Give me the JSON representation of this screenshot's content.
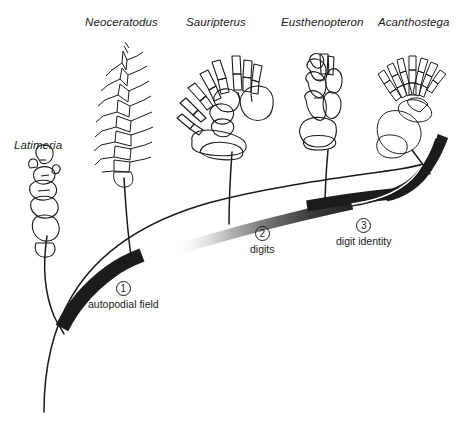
{
  "figure": {
    "width": 461,
    "height": 422,
    "background": "#ffffff",
    "line_color": "#1a1a1a",
    "band_dark_color": "#1c1c1c",
    "band_gradient_from": "#f2f2f2",
    "band_gradient_to": "#2b2b2b"
  },
  "taxa": [
    {
      "id": "latimeria",
      "label": "Latimeria",
      "label_x": 14,
      "label_y": 139,
      "specimen": "lobe-fin-skeleton"
    },
    {
      "id": "neoceratodus",
      "label": "Neoceratodus",
      "label_x": 85,
      "label_y": 16,
      "specimen": "archipterygium-fin-skeleton"
    },
    {
      "id": "sauripterus",
      "label": "Sauripterus",
      "label_x": 186,
      "label_y": 16,
      "specimen": "fin-skeleton-with-radials"
    },
    {
      "id": "eusthenopteron",
      "label": "Eusthenopteron",
      "label_x": 281,
      "label_y": 16,
      "specimen": "fin-skeleton"
    },
    {
      "id": "acanthostega",
      "label": "Acanthostega",
      "label_x": 378,
      "label_y": 16,
      "specimen": "limb-skeleton-with-digits"
    }
  ],
  "nodes": [
    {
      "id": "node-1",
      "number": "1",
      "text": "autopodial field",
      "x": 88,
      "y": 281
    },
    {
      "id": "node-2",
      "number": "2",
      "text": "digits",
      "x": 250,
      "y": 226
    },
    {
      "id": "node-3",
      "number": "3",
      "text": "digit identity",
      "x": 336,
      "y": 218
    }
  ]
}
